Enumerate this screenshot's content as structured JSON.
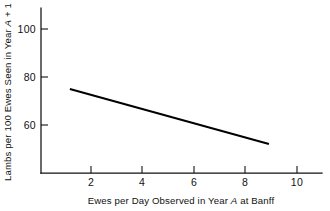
{
  "figure": {
    "background_color": "#ffffff",
    "ink_color": "#111111",
    "line_color": "#000000"
  },
  "chart_data": {
    "type": "line",
    "title": "",
    "subtitle": "",
    "xlabel_parts": {
      "before": "Ewes per Day Observed in Year ",
      "variable": "A",
      "after": " at Banff"
    },
    "xlabel": "Ewes per Day Observed in Year A at Banff",
    "ylabel_parts": {
      "before": "Lambs per 100 Ewes Seen in Year ",
      "variable": "A",
      "after": " + 1"
    },
    "ylabel": "Lambs per 100 Ewes Seen in Year A + 1",
    "xlim": [
      0,
      11.0
    ],
    "ylim": [
      40,
      105
    ],
    "xticks": [
      2,
      4,
      6,
      8,
      10
    ],
    "xtick_labels": [
      "2",
      "4",
      "6",
      "8",
      "10"
    ],
    "yticks": [
      60,
      80,
      100
    ],
    "ytick_labels": [
      "60",
      "80",
      "100"
    ],
    "grid": false,
    "legend": null,
    "legend_position": "none",
    "series": [
      {
        "name": "fitted regression line",
        "x": [
          1.18,
          8.91
        ],
        "values": [
          75.0,
          52.1
        ]
      }
    ],
    "annotations": []
  }
}
